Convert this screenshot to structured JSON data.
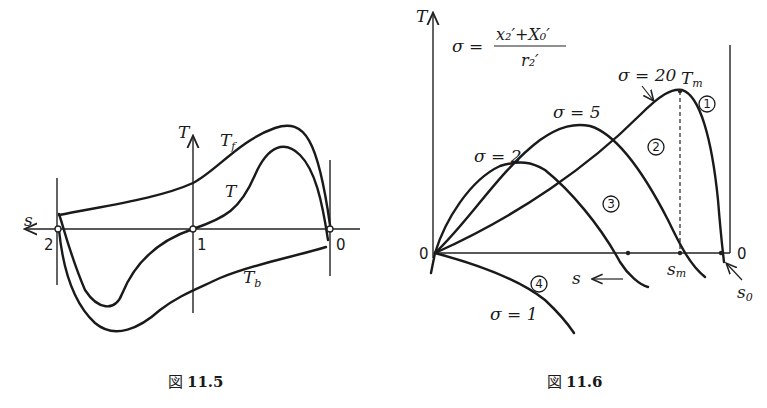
{
  "figure_11_5": {
    "caption_prefix": "図",
    "caption_number": "11.5",
    "axis_labels": {
      "vertical": "T",
      "horizontal": "s"
    },
    "points": {
      "left": "2",
      "center": "1",
      "right": "0"
    },
    "curve_labels": {
      "forward": "T",
      "forward_sub": "f",
      "net": "T",
      "backward": "T",
      "backward_sub": "b"
    }
  },
  "figure_11_6": {
    "caption_prefix": "図",
    "caption_number": "11.6",
    "axis_labels": {
      "vertical": "T",
      "origin": "0",
      "right_origin": "0"
    },
    "formula": {
      "lhs": "σ =",
      "numerator": "x₂′+X₀′",
      "denominator": "r₂′"
    },
    "slip_arrow_label": "s ←",
    "markers": {
      "max_torque": "T",
      "max_torque_sub": "m",
      "slip_max": "s",
      "slip_max_sub": "m",
      "slip_zero": "s",
      "slip_zero_sub": "0"
    },
    "curves": [
      {
        "id": "1",
        "circle": "①",
        "sigma_label": "σ = 20"
      },
      {
        "id": "2",
        "circle": "②",
        "sigma_label": "σ = 5"
      },
      {
        "id": "3",
        "circle": "③",
        "sigma_label": "σ = 2"
      },
      {
        "id": "4",
        "circle": "④",
        "sigma_label": "σ = 1"
      }
    ]
  }
}
